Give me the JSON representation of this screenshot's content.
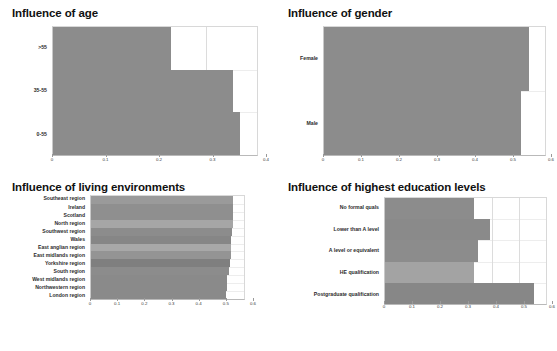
{
  "page": {
    "background": "#ffffff",
    "bar_color_dark": "#8c8c8c",
    "bar_color_light": "#a8a8a8"
  },
  "panels": [
    {
      "id": "age",
      "title": "Influence of age"
    },
    {
      "id": "gender",
      "title": "Influence of gender"
    },
    {
      "id": "living",
      "title": "Influence of living environments"
    },
    {
      "id": "education",
      "title": "Influence of highest education levels"
    }
  ],
  "chart_data": [
    {
      "type": "bar",
      "orientation": "horizontal",
      "title": "Influence of age",
      "xlabel": "",
      "ylabel": "",
      "xlim": [
        0,
        0.4
      ],
      "xticks": [
        "0",
        "0.1",
        "0.2",
        "0.3",
        "0.4"
      ],
      "xtick_values": [
        0,
        0.1,
        0.2,
        0.3,
        0.4
      ],
      "grid": true,
      "legend": "none",
      "categories": [
        ">55",
        "35-55",
        "0-55"
      ],
      "values": [
        0.232,
        0.353,
        0.367
      ],
      "colors": [
        "#8c8c8c",
        "#8c8c8c",
        "#8c8c8c"
      ]
    },
    {
      "type": "bar",
      "orientation": "horizontal",
      "title": "Influence of gender",
      "xlabel": "",
      "ylabel": "",
      "xlim": [
        0,
        0.6
      ],
      "xticks": [
        "0",
        "0.1",
        "0.2",
        "0.3",
        "0.4",
        "0.5",
        "0.6"
      ],
      "xtick_values": [
        0,
        0.1,
        0.2,
        0.3,
        0.4,
        0.5,
        0.6
      ],
      "grid": true,
      "legend": "none",
      "categories": [
        "Female",
        "Male"
      ],
      "values": [
        0.556,
        0.535
      ],
      "colors": [
        "#8c8c8c",
        "#8c8c8c"
      ]
    },
    {
      "type": "bar",
      "orientation": "horizontal",
      "title": "Influence of living environments",
      "xlabel": "",
      "ylabel": "",
      "xlim": [
        0,
        0.6
      ],
      "xticks": [
        "0",
        "0.1",
        "0.2",
        "0.3",
        "0.4",
        "0.5",
        "0.6"
      ],
      "xtick_values": [
        0,
        0.1,
        0.2,
        0.3,
        0.4,
        0.5,
        0.6
      ],
      "grid": true,
      "legend": "none",
      "categories": [
        "Southeast region",
        "Ireland",
        "Scotland",
        "North region",
        "Southwest region",
        "Wales",
        "East anglian region",
        "East midlands region",
        "Yorkshire region",
        "South region",
        "West midlands region",
        "Northwestern region",
        "London region"
      ],
      "values": [
        0.556,
        0.556,
        0.556,
        0.555,
        0.552,
        0.549,
        0.548,
        0.548,
        0.546,
        0.54,
        0.534,
        0.532,
        0.53
      ],
      "colors": [
        "#9a9a9a",
        "#8f8f8f",
        "#8f8f8f",
        "#a6a6a6",
        "#8c8c8c",
        "#868686",
        "#a8a8a8",
        "#949494",
        "#7f7f7f",
        "#8c8c8c",
        "#8a8a8a",
        "#8a8a8a",
        "#8a8a8a"
      ]
    },
    {
      "type": "bar",
      "orientation": "horizontal",
      "title": "Influence of highest education levels",
      "xlabel": "",
      "ylabel": "",
      "xlim": [
        0,
        0.6
      ],
      "xticks": [
        "0",
        "0.1",
        "0.2",
        "0.3",
        "0.4",
        "0.5",
        "0.6"
      ],
      "xtick_values": [
        0,
        0.1,
        0.2,
        0.3,
        0.4,
        0.5,
        0.6
      ],
      "grid": true,
      "legend": "none",
      "categories": [
        "No formal quals",
        "Lower than A level",
        "A level or equivalent",
        "HE qualification",
        "Postgraduate qualification"
      ],
      "values": [
        0.33,
        0.391,
        0.345,
        0.33,
        0.555
      ],
      "colors": [
        "#8c8c8c",
        "#8a8a8a",
        "#8c8c8c",
        "#a3a3a3",
        "#878787"
      ]
    }
  ]
}
